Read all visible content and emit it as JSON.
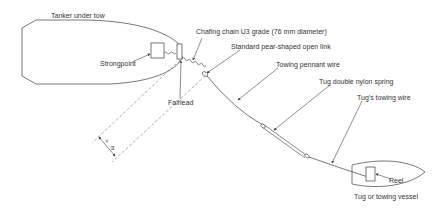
{
  "diagram": {
    "type": "emergency towing arrangement",
    "colors": {
      "line": "#444444",
      "text": "#333333",
      "background": "#ffffff"
    },
    "labels": {
      "tanker": "Tanker under tow",
      "strongpoint": "Strongpoint",
      "fairlead": "Fairlead",
      "chafing_chain": "Chafing chain U3 grade (76 mm diameter)",
      "pear_link": "Standard pear-shaped open link",
      "pennant_wire": "Towing pennant wire",
      "nylon_spring": "Tug double nylon spring",
      "tug_wire": "Tug's towing wire",
      "reel": "Reel",
      "tug": "Tug or towing vessel",
      "dimension": "> 3 m"
    },
    "dimension_text": {
      "symbol": ">",
      "unit": "m"
    }
  }
}
